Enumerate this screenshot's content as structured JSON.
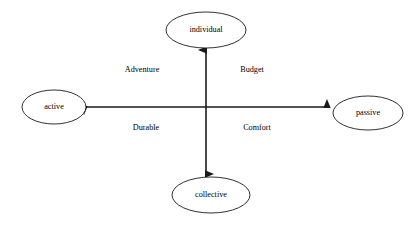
{
  "diagram": {
    "type": "quadrant-map",
    "background_color": "#ffffff",
    "stroke_color": "#1a1a1a",
    "text_color": "#000000",
    "center": {
      "x": 206,
      "y": 107
    },
    "nodes": [
      {
        "id": "individual",
        "label": "individual",
        "position": "top",
        "cx": 206,
        "cy": 30,
        "rx": 40,
        "ry": 18
      },
      {
        "id": "active",
        "label": "active",
        "position": "left",
        "cx": 54,
        "cy": 107,
        "rx": 32,
        "ry": 17
      },
      {
        "id": "passive",
        "label": "passive",
        "position": "right",
        "cx": 368,
        "cy": 113,
        "rx": 35,
        "ry": 17
      },
      {
        "id": "collective",
        "label": "collective",
        "position": "bottom",
        "cx": 211,
        "cy": 195,
        "rx": 39,
        "ry": 18
      }
    ],
    "axes": [
      {
        "id": "vertical-axis",
        "orientation": "vertical",
        "from": "collective",
        "to": "individual",
        "arrowheads": "both",
        "x": 206,
        "y1": 50,
        "y2": 174
      },
      {
        "id": "horizontal-axis",
        "orientation": "horizontal",
        "from": "active",
        "to": "passive",
        "arrowheads": "both",
        "y": 107,
        "x1": 84,
        "x2": 327
      }
    ],
    "quadrant_labels": [
      {
        "id": "adventure",
        "label": "Adventure",
        "quadrant": "top-left",
        "x": 142,
        "y": 70
      },
      {
        "id": "budget",
        "label": "Budget",
        "quadrant": "top-right",
        "x": 252,
        "y": 70
      },
      {
        "id": "durable",
        "label": "Durable",
        "quadrant": "bottom-left",
        "x": 146,
        "y": 128
      },
      {
        "id": "comfort",
        "label": "Comfort",
        "quadrant": "bottom-right",
        "x": 257,
        "y": 128
      }
    ]
  }
}
